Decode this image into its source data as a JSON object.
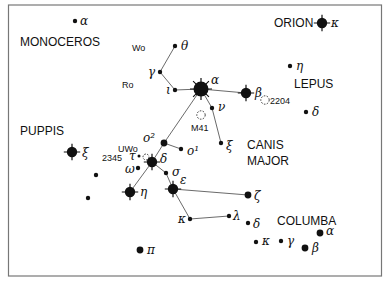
{
  "constellations": [
    {
      "name": "MONOCEROS",
      "x": 20,
      "y": 46
    },
    {
      "name": "ORION",
      "x": 274,
      "y": 27
    },
    {
      "name": "LEPUS",
      "x": 294,
      "y": 88
    },
    {
      "name": "PUPPIS",
      "x": 20,
      "y": 135
    },
    {
      "name": "CANIS",
      "x": 247,
      "y": 149
    },
    {
      "name": "MAJOR",
      "x": 247,
      "y": 165
    },
    {
      "name": "COLUMBA",
      "x": 277,
      "y": 225
    }
  ],
  "stars": [
    {
      "id": "mon_alpha",
      "label": "α",
      "x": 75,
      "y": 21,
      "size": "s",
      "lx": 80,
      "ly": 25
    },
    {
      "id": "ori_kappa",
      "label": "κ",
      "x": 322,
      "y": 23,
      "size": "l",
      "lx": 331,
      "ly": 27
    },
    {
      "id": "lep_eta",
      "label": "η",
      "x": 290,
      "y": 66,
      "size": "s",
      "lx": 296,
      "ly": 70
    },
    {
      "id": "lep_delta",
      "label": "δ",
      "x": 306,
      "y": 112,
      "size": "s",
      "lx": 312,
      "ly": 116
    },
    {
      "id": "cma_theta",
      "label": "θ",
      "x": 175,
      "y": 46,
      "size": "s",
      "lx": 181,
      "ly": 50
    },
    {
      "id": "cma_gamma",
      "label": "γ",
      "x": 160,
      "y": 72,
      "size": "s",
      "lx": 148,
      "ly": 76
    },
    {
      "id": "cma_iota",
      "label": "ι",
      "x": 175,
      "y": 90,
      "size": "s",
      "lx": 166,
      "ly": 94
    },
    {
      "id": "cma_alpha",
      "label": "α",
      "x": 201,
      "y": 89,
      "size": "xl",
      "lx": 211,
      "ly": 84
    },
    {
      "id": "cma_beta",
      "label": "β",
      "x": 246,
      "y": 93,
      "size": "l",
      "lx": 255,
      "ly": 97
    },
    {
      "id": "cma_nu",
      "label": "ν",
      "x": 212,
      "y": 108,
      "size": "s",
      "lx": 218,
      "ly": 111
    },
    {
      "id": "cma_xi",
      "label": "ξ",
      "x": 221,
      "y": 143,
      "size": "s",
      "lx": 226,
      "ly": 150
    },
    {
      "id": "cma_o2",
      "label": "o²",
      "x": 164,
      "y": 143,
      "size": "m",
      "lx": 143,
      "ly": 142
    },
    {
      "id": "cma_o1",
      "label": "o¹",
      "x": 181,
      "y": 149,
      "size": "s",
      "lx": 187,
      "ly": 155
    },
    {
      "id": "cma_delta",
      "label": "δ",
      "x": 152,
      "y": 162,
      "size": "l",
      "lx": 160,
      "ly": 163
    },
    {
      "id": "cma_tau",
      "label": "τ",
      "x": 139,
      "y": 156,
      "size": "xs",
      "lx": 129,
      "ly": 160
    },
    {
      "id": "cma_omega",
      "label": "ω",
      "x": 138,
      "y": 168,
      "size": "s",
      "lx": 125,
      "ly": 173
    },
    {
      "id": "cma_sigma",
      "label": "σ",
      "x": 166,
      "y": 173,
      "size": "s",
      "lx": 172,
      "ly": 176
    },
    {
      "id": "cma_eta",
      "label": "η",
      "x": 130,
      "y": 192,
      "size": "l",
      "lx": 140,
      "ly": 196
    },
    {
      "id": "cma_epsilon",
      "label": "ε",
      "x": 173,
      "y": 189,
      "size": "l",
      "lx": 180,
      "ly": 184
    },
    {
      "id": "cma_zeta",
      "label": "ζ",
      "x": 248,
      "y": 195,
      "size": "m",
      "lx": 254,
      "ly": 200
    },
    {
      "id": "cma_kappa",
      "label": "κ",
      "x": 190,
      "y": 219,
      "size": "s",
      "lx": 178,
      "ly": 223
    },
    {
      "id": "cma_lambda",
      "label": "λ",
      "x": 229,
      "y": 216,
      "size": "s",
      "lx": 233,
      "ly": 220
    },
    {
      "id": "col_delta",
      "label": "δ",
      "x": 248,
      "y": 223,
      "size": "s",
      "lx": 253,
      "ly": 228
    },
    {
      "id": "col_alpha",
      "label": "α",
      "x": 320,
      "y": 233,
      "size": "m",
      "lx": 326,
      "ly": 235
    },
    {
      "id": "col_kappa",
      "label": "κ",
      "x": 256,
      "y": 242,
      "size": "s",
      "lx": 262,
      "ly": 245
    },
    {
      "id": "col_gamma",
      "label": "γ",
      "x": 281,
      "y": 241,
      "size": "s",
      "lx": 287,
      "ly": 245
    },
    {
      "id": "col_beta",
      "label": "β",
      "x": 305,
      "y": 248,
      "size": "m",
      "lx": 312,
      "ly": 252
    },
    {
      "id": "pup_xi",
      "label": "ξ",
      "x": 72,
      "y": 152,
      "size": "l",
      "lx": 82,
      "ly": 157
    },
    {
      "id": "pup_pi",
      "label": "π",
      "x": 140,
      "y": 250,
      "size": "m",
      "lx": 147,
      "ly": 254
    },
    {
      "id": "pup_1",
      "label": "",
      "x": 96,
      "y": 175,
      "size": "s"
    },
    {
      "id": "pup_2",
      "label": "",
      "x": 88,
      "y": 198,
      "size": "s"
    }
  ],
  "lines": [
    [
      "cma_theta",
      "cma_gamma"
    ],
    [
      "cma_gamma",
      "cma_iota"
    ],
    [
      "cma_iota",
      "cma_alpha"
    ],
    [
      "cma_alpha",
      "cma_beta"
    ],
    [
      "cma_alpha",
      "cma_nu"
    ],
    [
      "cma_nu",
      "cma_xi"
    ],
    [
      "cma_alpha",
      "cma_o2"
    ],
    [
      "cma_o2",
      "cma_o1"
    ],
    [
      "cma_o2",
      "cma_delta"
    ],
    [
      "cma_delta",
      "cma_eta"
    ],
    [
      "cma_delta",
      "cma_sigma"
    ],
    [
      "cma_sigma",
      "cma_epsilon"
    ],
    [
      "cma_epsilon",
      "cma_zeta"
    ],
    [
      "cma_epsilon",
      "cma_kappa"
    ],
    [
      "cma_kappa",
      "cma_lambda"
    ]
  ],
  "objects": [
    {
      "id": "m41",
      "label": "M41",
      "x": 201,
      "y": 115,
      "lx": 191,
      "ly": 131
    },
    {
      "id": "ngc2204",
      "label": "2204",
      "x": 265,
      "y": 100,
      "lx": 270,
      "ly": 104
    },
    {
      "id": "ngc2362",
      "label": "",
      "x": 146,
      "y": 157
    }
  ],
  "annotations": [
    {
      "text": "Wo",
      "x": 132,
      "y": 51
    },
    {
      "text": "Ro",
      "x": 122,
      "y": 88
    },
    {
      "text": "UWo",
      "x": 118,
      "y": 152
    },
    {
      "text": "2345",
      "x": 102,
      "y": 161
    }
  ]
}
